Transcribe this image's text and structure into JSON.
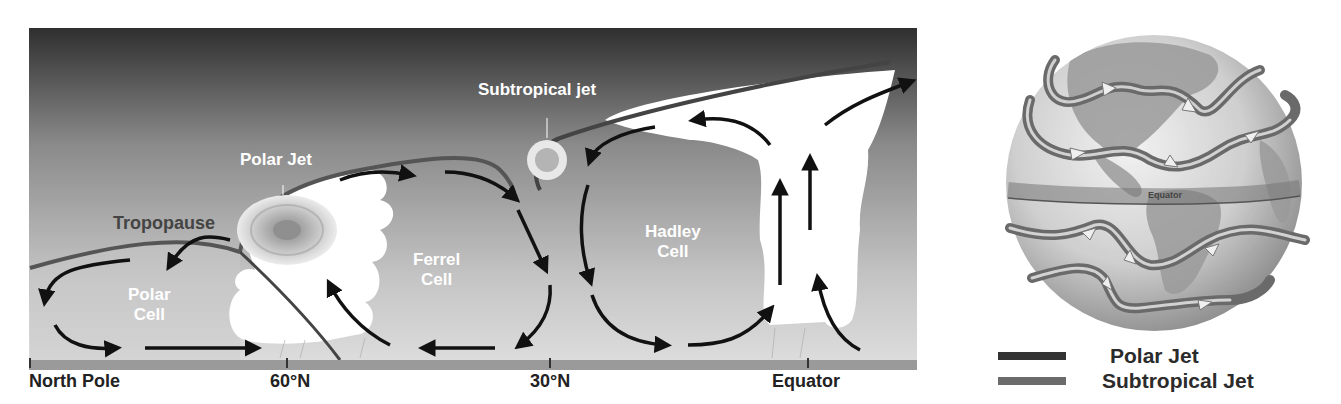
{
  "cross_section": {
    "labels": {
      "tropopause": "Tropopause",
      "polar_jet": "Polar Jet",
      "subtropical_jet": "Subtropical jet",
      "polar_cell_line1": "Polar",
      "polar_cell_line2": "Cell",
      "ferrel_cell_line1": "Ferrel",
      "ferrel_cell_line2": "Cell",
      "hadley_cell_line1": "Hadley",
      "hadley_cell_line2": "Cell"
    },
    "axis": {
      "ticks": [
        "North Pole",
        "60°N",
        "30°N",
        "Equator"
      ]
    },
    "colors": {
      "sky_top": "#2e2e2e",
      "sky_bottom": "#d8d8d8",
      "tropopause_line": "#555555",
      "ground_bar": "#9a9a9a",
      "arrow": "#111111",
      "cloud": "#ffffff"
    }
  },
  "globe": {
    "equator_label": "Equator",
    "legend": [
      {
        "label": "Polar Jet",
        "color": "#333333"
      },
      {
        "label": "Subtropical Jet",
        "color": "#6b6b6b"
      }
    ]
  }
}
